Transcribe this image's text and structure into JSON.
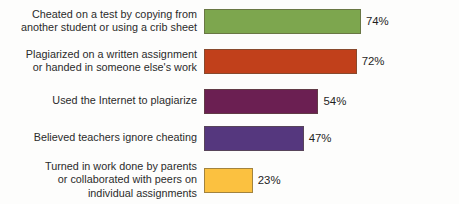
{
  "chart_data": {
    "type": "bar",
    "orientation": "horizontal",
    "title": "",
    "xlabel": "",
    "ylabel": "",
    "xlim": [
      0,
      100
    ],
    "grid": false,
    "legend": false,
    "categories": [
      "Cheated on a test by copying from another student or using a crib sheet",
      "Plagiarized on a written assignment or handed in someone else's work",
      "Used the Internet to plagiarize",
      "Believed teachers ignore cheating",
      "Turned in work done by parents or collaborated with peers on individual assignments"
    ],
    "values": [
      74,
      72,
      54,
      47,
      23
    ],
    "value_labels": [
      "74%",
      "72%",
      "54%",
      "47%",
      "23%"
    ],
    "colors": [
      "#7da64e",
      "#c1401b",
      "#6b1f52",
      "#55377e",
      "#fbc140"
    ],
    "bars": [
      {
        "label_lines": [
          "Cheated on a test by copying from",
          "another student or using a crib sheet"
        ],
        "value": 74,
        "value_label": "74%",
        "color": "#7da64e"
      },
      {
        "label_lines": [
          "Plagiarized on a written assignment",
          "or handed in someone else's work"
        ],
        "value": 72,
        "value_label": "72%",
        "color": "#c1401b"
      },
      {
        "label_lines": [
          "Used the Internet to plagiarize"
        ],
        "value": 54,
        "value_label": "54%",
        "color": "#6b1f52"
      },
      {
        "label_lines": [
          "Believed teachers ignore cheating"
        ],
        "value": 47,
        "value_label": "47%",
        "color": "#55377e"
      },
      {
        "label_lines": [
          "Turned in work done by parents",
          "or collaborated with peers on",
          "individual assignments"
        ],
        "value": 23,
        "value_label": "23%",
        "color": "#fbc140"
      }
    ]
  }
}
